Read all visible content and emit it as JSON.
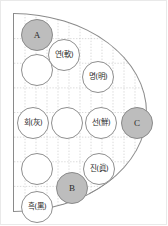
{
  "figure": {
    "frame_color": "#e9e9e9",
    "outline_color": "#8a8a8a",
    "grid_color": "#c9c9c9",
    "shaded_fill": "#bdbdbd",
    "node_fill": "#ffffff",
    "node_stroke": "#8f8f8f",
    "text_color": "#2b2b2b"
  },
  "chart_data": {
    "type": "scatter",
    "title": "",
    "xlabel": "",
    "ylabel": "",
    "grid": true,
    "shape": "half-disc",
    "nodes": [
      {
        "id": "n1",
        "label": "A",
        "kind": "letter",
        "shaded": true,
        "x": 24,
        "y": 22,
        "r": 16
      },
      {
        "id": "n2",
        "label": "연(軟)",
        "kind": "term",
        "shaded": false,
        "x": 51,
        "y": 42,
        "r": 16
      },
      {
        "id": "n3",
        "label": "명(明)",
        "kind": "term",
        "shaded": false,
        "x": 85,
        "y": 64,
        "r": 16
      },
      {
        "id": "n4",
        "label": "",
        "kind": "blank",
        "shaded": false,
        "x": 24,
        "y": 57,
        "r": 16
      },
      {
        "id": "n5",
        "label": "회(灰)",
        "kind": "term",
        "shaded": false,
        "x": 20,
        "y": 110,
        "r": 16
      },
      {
        "id": "n6",
        "label": "",
        "kind": "blank",
        "shaded": false,
        "x": 54,
        "y": 110,
        "r": 16
      },
      {
        "id": "n7",
        "label": "선(鮮)",
        "kind": "term",
        "shaded": false,
        "x": 88,
        "y": 110,
        "r": 16
      },
      {
        "id": "n8",
        "label": "C",
        "kind": "letter",
        "shaded": true,
        "x": 124,
        "y": 110,
        "r": 16
      },
      {
        "id": "n9",
        "label": "",
        "kind": "blank",
        "shaded": false,
        "x": 24,
        "y": 156,
        "r": 16
      },
      {
        "id": "n10",
        "label": "진(眞)",
        "kind": "term",
        "shaded": false,
        "x": 86,
        "y": 156,
        "r": 16
      },
      {
        "id": "n11",
        "label": "B",
        "kind": "letter",
        "shaded": true,
        "x": 59,
        "y": 175,
        "r": 16
      },
      {
        "id": "n12",
        "label": "흑(黑)",
        "kind": "term",
        "shaded": false,
        "x": 24,
        "y": 194,
        "r": 16
      }
    ],
    "legend": [],
    "annotations": []
  }
}
